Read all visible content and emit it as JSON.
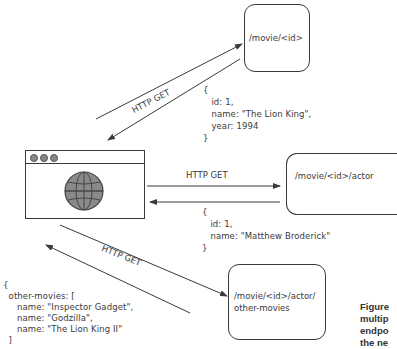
{
  "endpoints": [
    {
      "id": "movie",
      "label": "/movie/<id>"
    },
    {
      "id": "actor",
      "label": "/movie/<id>/actor"
    },
    {
      "id": "other_movies",
      "label": "/movie/<id>/actor/\nother-movies"
    }
  ],
  "requests": [
    {
      "label": "HTTP GET",
      "target": "movie"
    },
    {
      "label": "HTTP GET",
      "target": "actor"
    },
    {
      "label": "HTTP GET",
      "target": "other_movies"
    }
  ],
  "responses": {
    "movie": "{\n   id: 1,\n   name: \"The Lion King\",\n   year: 1994\n}",
    "actor": "{\n   id: 1,\n   name: \"Matthew Broderick\"\n}",
    "other_movies": "{\n  other-movies: [\n     name: \"Inspector Gadget\",\n     name: \"Godzilla\",\n     name: \"The Lion King II\"\n  ]"
  },
  "client": {
    "icon": "globe-icon",
    "window_dots": 3
  },
  "caption": "Figure\nmultip\nendpo\nthe ne",
  "colors": {
    "stroke": "#3a3a3a",
    "globe": "#8a8a8a"
  }
}
